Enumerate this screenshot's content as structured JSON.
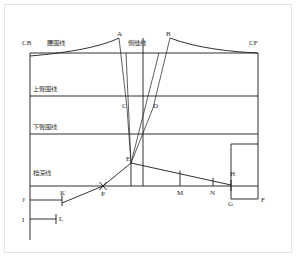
{
  "diagram": {
    "type": "garment-pattern-draft",
    "colors": {
      "line": "#1a1a1a",
      "thin_line": "#2a2a2a",
      "frame": "#e2e2e2",
      "text": "#2b2b2b",
      "background": "#ffffff"
    },
    "guide_labels": [
      {
        "key": "cb",
        "text": "CB",
        "x": 22,
        "y": 45
      },
      {
        "key": "waistline",
        "text": "腰围线",
        "x": 47,
        "y": 45
      },
      {
        "key": "sideseam",
        "text": "侧缝线",
        "x": 130,
        "y": 45
      },
      {
        "key": "cf",
        "text": "CF",
        "x": 250,
        "y": 45
      },
      {
        "key": "upper_hip",
        "text": "上臀围线",
        "x": 33,
        "y": 91
      },
      {
        "key": "lower_hip",
        "text": "下臀围线",
        "x": 33,
        "y": 129
      },
      {
        "key": "crotch",
        "text": "档深线",
        "x": 33,
        "y": 175
      }
    ],
    "points": [
      {
        "key": "A",
        "text": "A",
        "x": 119,
        "y": 36
      },
      {
        "key": "B",
        "text": "B",
        "x": 166,
        "y": 36
      },
      {
        "key": "C",
        "text": "C",
        "x": 126,
        "y": 108
      },
      {
        "key": "D",
        "text": "D",
        "x": 154,
        "y": 108
      },
      {
        "key": "E",
        "text": "E",
        "x": 131,
        "y": 160
      },
      {
        "key": "H",
        "text": "H",
        "x": 233,
        "y": 172
      },
      {
        "key": "J",
        "text": "J",
        "x": 22,
        "y": 196
      },
      {
        "key": "K",
        "text": "K",
        "x": 61,
        "y": 192
      },
      {
        "key": "P",
        "text": "P",
        "x": 101,
        "y": 196
      },
      {
        "key": "M",
        "text": "M",
        "x": 180,
        "y": 192
      },
      {
        "key": "N",
        "text": "N",
        "x": 213,
        "y": 192
      },
      {
        "key": "G",
        "text": "G",
        "x": 231,
        "y": 201
      },
      {
        "key": "F",
        "text": "F",
        "x": 261,
        "y": 197
      },
      {
        "key": "I",
        "text": "I",
        "x": 22,
        "y": 222
      },
      {
        "key": "L",
        "text": "L",
        "x": 59,
        "y": 220
      }
    ],
    "construction_lines": {
      "frame_rect": {
        "x1": 30,
        "y1": 53,
        "x2": 258,
        "y2": 186
      },
      "horizontal_guides": [
        {
          "key": "upper-hip-line",
          "y": 96
        },
        {
          "key": "lower-hip-line",
          "y": 134
        },
        {
          "key": "crotch-line",
          "y": 186
        }
      ],
      "waist_curve_left": "M 30,56 C 70,52 100,46 119,38",
      "waist_curve_right": "M 170,38 C 195,48 232,52 258,53",
      "center_vertical": {
        "x": 143,
        "y1": 38,
        "y2": 186
      },
      "dart_left": "M 119,38 L 128,110 L 131,163",
      "dart_right": "M 170,38 L 152,110 L 131,163",
      "dart_inner_left": "M 124,52 L 131,163",
      "dart_inner_right": "M 160,52 L 131,163",
      "e_to_p": {
        "x1": 131,
        "y1": 163,
        "x2": 103,
        "y2": 186
      },
      "p_to_k": {
        "x1": 103,
        "y1": 186,
        "x2": 62,
        "y2": 203
      },
      "e_to_h": {
        "x1": 131,
        "y1": 163,
        "x2": 231,
        "y2": 185
      },
      "e_vertical": {
        "x": 131,
        "y1": 163,
        "y2": 186
      },
      "m_tick": {
        "x": 180,
        "y1": 170,
        "y2": 186
      },
      "n_tick": {
        "x": 213,
        "y1": 178,
        "y2": 186
      },
      "h_tick": {
        "x": 231,
        "y1": 180,
        "y2": 190
      },
      "right_box": {
        "x1": 231,
        "y1": 144,
        "x2": 258,
        "y2": 199
      },
      "left_vertical": {
        "x": 30,
        "y1": 186,
        "y2": 240
      },
      "j_line": {
        "x1": 30,
        "y1": 200,
        "x2": 62,
        "y2": 200
      },
      "k_tick": {
        "x": 62,
        "y1": 195,
        "y2": 206
      },
      "i_line": {
        "x1": 30,
        "y1": 219,
        "x2": 56,
        "y2": 219
      },
      "l_tick": {
        "x": 56,
        "y1": 214,
        "y2": 224
      },
      "p_cross": {
        "cx": 103,
        "cy": 186,
        "r": 5
      },
      "g_f_line": {
        "x1": 231,
        "y1": 199,
        "x2": 258,
        "y2": 199
      }
    }
  }
}
